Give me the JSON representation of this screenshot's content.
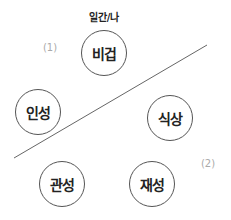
{
  "diagram": {
    "top_label": "일간/나",
    "nodes": [
      {
        "id": "bigeop",
        "label": "비겁",
        "x": 104,
        "y": 53
      },
      {
        "id": "inseong",
        "label": "인성",
        "x": 38,
        "y": 112
      },
      {
        "id": "siksang",
        "label": "식상",
        "x": 170,
        "y": 118
      },
      {
        "id": "gwanseong",
        "label": "관성",
        "x": 62,
        "y": 184
      },
      {
        "id": "jaeseong",
        "label": "재성",
        "x": 152,
        "y": 184
      }
    ],
    "region_marks": [
      {
        "label": "(1)",
        "x": 50,
        "y": 47
      },
      {
        "label": "(2)",
        "x": 208,
        "y": 163
      }
    ],
    "divider_line": {
      "x1": 14,
      "y1": 158,
      "x2": 207,
      "y2": 45,
      "color": "#666666"
    },
    "colors": {
      "circle_stroke": "#555555",
      "text": "#222222",
      "mark": "#aaaaaa"
    }
  }
}
